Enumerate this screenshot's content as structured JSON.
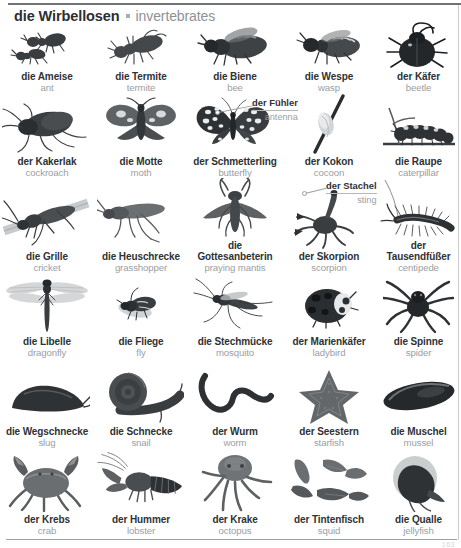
{
  "header": {
    "german_title": "die Wirbellosen",
    "separator": "bullet-separator",
    "english_title": "invertebrates"
  },
  "page_number": "163",
  "colors": {
    "german_text": "#2e3236",
    "english_text": "#9aa0a4",
    "rule": "#6f7376",
    "background": "#ffffff"
  },
  "rows": [
    {
      "row_index": 1,
      "entries": [
        {
          "de": "die Ameise",
          "en": "ant",
          "icon": "ant-illustration"
        },
        {
          "de": "die Termite",
          "en": "termite",
          "icon": "termite-illustration"
        },
        {
          "de": "die Biene",
          "en": "bee",
          "icon": "bee-illustration"
        },
        {
          "de": "die Wespe",
          "en": "wasp",
          "icon": "wasp-illustration"
        },
        {
          "de": "der Käfer",
          "en": "beetle",
          "icon": "beetle-illustration"
        }
      ]
    },
    {
      "row_index": 2,
      "entries": [
        {
          "de": "der Kakerlak",
          "en": "cockroach",
          "icon": "cockroach-illustration"
        },
        {
          "de": "die Motte",
          "en": "moth",
          "icon": "moth-illustration"
        },
        {
          "de": "der Schmetterling",
          "en": "butterfly",
          "icon": "butterfly-illustration"
        },
        {
          "de": "der Kokon",
          "en": "cocoon",
          "icon": "cocoon-illustration"
        },
        {
          "de": "die Raupe",
          "en": "caterpillar",
          "icon": "caterpillar-illustration"
        }
      ]
    },
    {
      "row_index": 3,
      "entries": [
        {
          "de": "die Grille",
          "en": "cricket",
          "icon": "cricket-illustration"
        },
        {
          "de": "die Heuschrecke",
          "en": "grasshopper",
          "icon": "grasshopper-illustration"
        },
        {
          "de": "die Gottesanbeterin",
          "en": "praying mantis",
          "icon": "praying-mantis-illustration"
        },
        {
          "de": "der Skorpion",
          "en": "scorpion",
          "icon": "scorpion-illustration"
        },
        {
          "de": "der Tausendfüßer",
          "en": "centipede",
          "icon": "centipede-illustration"
        }
      ]
    },
    {
      "row_index": 4,
      "entries": [
        {
          "de": "die Libelle",
          "en": "dragonfly",
          "icon": "dragonfly-illustration"
        },
        {
          "de": "die Fliege",
          "en": "fly",
          "icon": "fly-illustration"
        },
        {
          "de": "die Stechmücke",
          "en": "mosquito",
          "icon": "mosquito-illustration"
        },
        {
          "de": "der Marienkäfer",
          "en": "ladybird",
          "icon": "ladybird-illustration"
        },
        {
          "de": "die Spinne",
          "en": "spider",
          "icon": "spider-illustration"
        }
      ]
    },
    {
      "row_index": 5,
      "entries": [
        {
          "de": "die Wegschnecke",
          "en": "slug",
          "icon": "slug-illustration"
        },
        {
          "de": "die Schnecke",
          "en": "snail",
          "icon": "snail-illustration"
        },
        {
          "de": "der Wurm",
          "en": "worm",
          "icon": "worm-illustration"
        },
        {
          "de": "der Seestern",
          "en": "starfish",
          "icon": "starfish-illustration"
        },
        {
          "de": "die Muschel",
          "en": "mussel",
          "icon": "mussel-illustration"
        }
      ]
    },
    {
      "row_index": 6,
      "entries": [
        {
          "de": "der Krebs",
          "en": "crab",
          "icon": "crab-illustration"
        },
        {
          "de": "der Hummer",
          "en": "lobster",
          "icon": "lobster-illustration"
        },
        {
          "de": "der Krake",
          "en": "octopus",
          "icon": "octopus-illustration"
        },
        {
          "de": "der Tintenfisch",
          "en": "squid",
          "icon": "squid-illustration"
        },
        {
          "de": "die Qualle",
          "en": "jellyfish",
          "icon": "jellyfish-illustration"
        }
      ]
    }
  ],
  "callouts": [
    {
      "de": "der Fühler",
      "en": "antenna",
      "points_to": "butterfly-antenna"
    },
    {
      "de": "der Stachel",
      "en": "sting",
      "points_to": "scorpion-sting"
    }
  ]
}
